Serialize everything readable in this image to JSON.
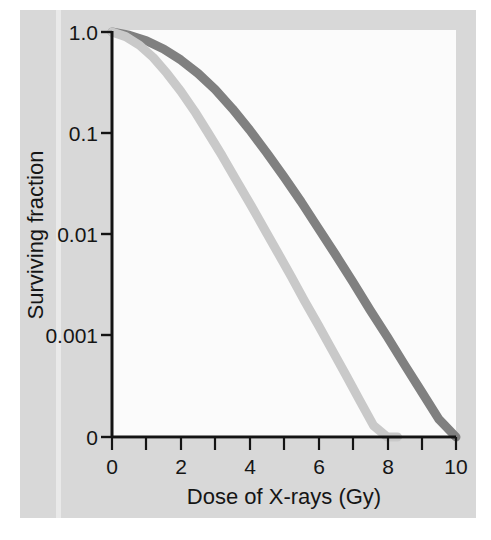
{
  "figure": {
    "background_color": "#d8d8d8",
    "canvas_color": "#fbfbfb"
  },
  "chart_data": {
    "type": "line",
    "title": "",
    "subtitle": "",
    "xlabel": "Dose of X-rays (Gy)",
    "ylabel": "Surviving fraction",
    "yscale": "log",
    "xscale": "linear",
    "xlim": [
      0,
      10
    ],
    "ylim": [
      0.0001,
      1.0
    ],
    "grid": false,
    "legend_position": "none",
    "xticks": [
      0,
      1,
      2,
      3,
      4,
      5,
      6,
      7,
      8,
      9,
      10
    ],
    "xtick_labels": [
      "0",
      "",
      "2",
      "",
      "4",
      "",
      "6",
      "",
      "8",
      "",
      "10"
    ],
    "xtick_labels_shown": [
      "0",
      "2",
      "4",
      "6",
      "8",
      "10"
    ],
    "yticks": [
      1.0,
      0.1,
      0.01,
      0.001,
      0.0001
    ],
    "ytick_labels": [
      "1.0",
      "0.1",
      "0.01",
      "0.001",
      "0"
    ],
    "series": [
      {
        "name": "radioresistant-cells",
        "color": "#808080",
        "linewidth": 9,
        "x": [
          0,
          0.5,
          1.0,
          1.5,
          2.0,
          2.5,
          3.0,
          3.5,
          4.0,
          4.5,
          5.0,
          5.5,
          6.0,
          6.5,
          7.0,
          7.5,
          8.0,
          8.5,
          9.0,
          9.5,
          10.0
        ],
        "y": [
          1.0,
          0.93,
          0.82,
          0.68,
          0.53,
          0.39,
          0.27,
          0.175,
          0.108,
          0.064,
          0.037,
          0.021,
          0.0115,
          0.0063,
          0.0034,
          0.0018,
          0.00098,
          0.00052,
          0.00028,
          0.00015,
          8e-05
        ],
        "reference_points": [
          {
            "x": 0.0,
            "y": 1.0
          },
          {
            "x": 3.7,
            "y": 0.1
          },
          {
            "x": 5.9,
            "y": 0.01
          },
          {
            "x": 8.1,
            "y": 0.001
          },
          {
            "x": 10.0,
            "y": 0.0003
          }
        ]
      },
      {
        "name": "radiosensitive-cells",
        "color": "#c9c9c9",
        "linewidth": 9,
        "x": [
          0,
          0.4,
          0.8,
          1.2,
          1.6,
          2.0,
          2.4,
          2.8,
          3.2,
          3.6,
          4.0,
          4.4,
          4.8,
          5.2,
          5.6,
          6.0,
          6.4,
          6.8,
          7.2,
          7.6,
          8.0,
          8.3
        ],
        "y": [
          1.0,
          0.9,
          0.74,
          0.56,
          0.39,
          0.26,
          0.165,
          0.1,
          0.06,
          0.035,
          0.0205,
          0.0118,
          0.0068,
          0.0039,
          0.0022,
          0.00127,
          0.00072,
          0.00041,
          0.00023,
          0.00013,
          8e-05,
          5e-05
        ],
        "reference_points": [
          {
            "x": 0.0,
            "y": 1.0
          },
          {
            "x": 2.6,
            "y": 0.1
          },
          {
            "x": 4.5,
            "y": 0.01
          },
          {
            "x": 6.4,
            "y": 0.001
          },
          {
            "x": 8.3,
            "y": 0.0001
          }
        ]
      }
    ],
    "annotations": []
  },
  "axes": {
    "x_title": "Dose of X-rays (Gy)",
    "y_title": "Surviving fraction",
    "y_labels": {
      "t1": "1.0",
      "t2": "0.1",
      "t3": "0.01",
      "t4": "0.001",
      "t5": "0"
    },
    "x_labels": {
      "t0": "0",
      "t2": "2",
      "t4": "4",
      "t6": "6",
      "t8": "8",
      "t10": "10"
    }
  }
}
